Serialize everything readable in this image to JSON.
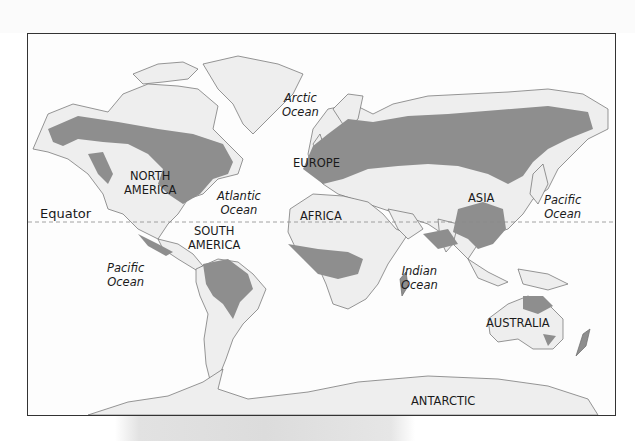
{
  "map": {
    "title": "World forest distribution map",
    "colors": {
      "ocean": "#fdfdfd",
      "land": "#eeeeee",
      "shaded_region": "#8e8e8e",
      "coastline": "#6a6a6a",
      "frame": "#333333",
      "equator_line": "#8a8a8a"
    },
    "continents": [
      {
        "id": "north-america",
        "label": "NORTH\nAMERICA"
      },
      {
        "id": "south-america",
        "label": "SOUTH\nAMERICA"
      },
      {
        "id": "europe",
        "label": "EUROPE"
      },
      {
        "id": "africa",
        "label": "AFRICA"
      },
      {
        "id": "asia",
        "label": "ASIA"
      },
      {
        "id": "australia",
        "label": "AUSTRALIA"
      },
      {
        "id": "antarctic",
        "label": "ANTARCTIC"
      }
    ],
    "oceans": [
      {
        "id": "arctic",
        "label": "Arctic\nOcean"
      },
      {
        "id": "atlantic",
        "label": "Atlantic\nOcean"
      },
      {
        "id": "pacific-west",
        "label": "Pacific\nOcean"
      },
      {
        "id": "pacific-east",
        "label": "Pacific\nOcean"
      },
      {
        "id": "indian",
        "label": "Indian\nOcean"
      }
    ],
    "equator": {
      "label": "Equator",
      "style": "dashed"
    }
  }
}
